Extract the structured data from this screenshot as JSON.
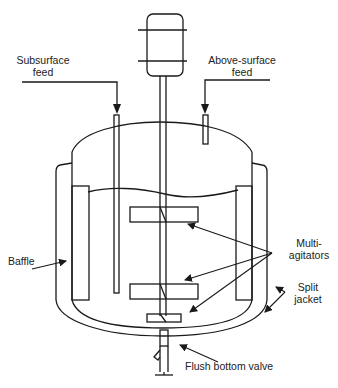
{
  "diagram": {
    "type": "stirred-tank-reactor",
    "labels": {
      "subsurface_feed_1": "Subsurface",
      "subsurface_feed_2": "feed",
      "above_surface_feed_1": "Above-surface",
      "above_surface_feed_2": "feed",
      "baffle": "Baffle",
      "multi_agitators_1": "Multi-",
      "multi_agitators_2": "agitators",
      "split_jacket_1": "Split",
      "split_jacket_2": "jacket",
      "flush_bottom_valve": "Flush bottom valve"
    },
    "components": [
      "motor",
      "shaft",
      "vessel",
      "split-jacket",
      "baffles",
      "subsurface-feed-pipe",
      "above-surface-feed-pipe",
      "agitator-impellers",
      "flush-bottom-valve"
    ],
    "stroke_color": "#1a1a1a"
  }
}
